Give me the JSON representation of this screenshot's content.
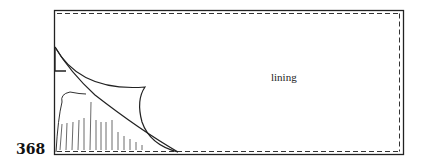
{
  "figure": {
    "number": "368",
    "labels": {
      "lining": "lining"
    },
    "colors": {
      "line": "#222222",
      "background": "#ffffff"
    },
    "elements": [
      "outer-rectangle",
      "inner-dashed-seam",
      "corner-triangle",
      "folded-corner-curve",
      "diagonal-fold-line",
      "hatched-cut-area"
    ]
  }
}
